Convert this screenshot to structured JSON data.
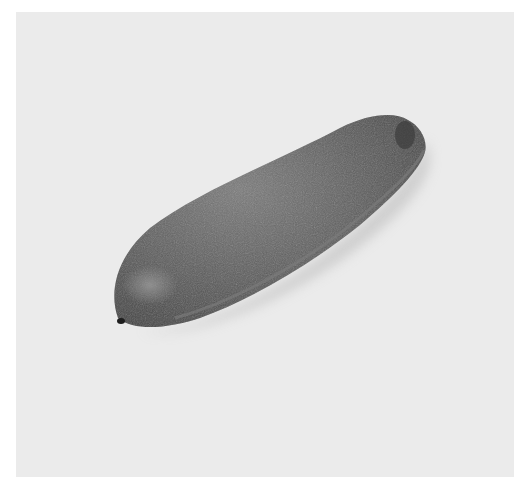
{
  "image": {
    "alt": "Grayscale photograph of a single elongated, textured oblong object lying diagonally on a light gray background",
    "subject": "elongated oblong object",
    "colors": {
      "page_background": "#ffffff",
      "panel_background": "#ebebeb",
      "object_dark": "#4a4a4a",
      "object_mid": "#6a6a6a",
      "object_highlight": "#8c8c8c",
      "shadow": "#d6d6d6"
    }
  }
}
